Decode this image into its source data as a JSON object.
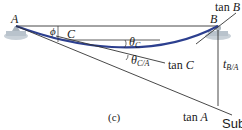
{
  "figure": {
    "caption": "(c)",
    "trailing_text": "Sub",
    "points": {
      "A": "A",
      "B": "B",
      "C": "C"
    },
    "labels": {
      "tan_B": {
        "word": "tan",
        "var": "B"
      },
      "tan_C": {
        "word": "tan",
        "var": "C"
      },
      "tan_A": {
        "word": "tan",
        "var": "A"
      },
      "theta_C": {
        "sym": "θ",
        "sub": "C"
      },
      "theta_CA": {
        "sym": "θ",
        "sub": "C/A"
      },
      "t_BA": {
        "sym": "t",
        "sub": "B/A"
      },
      "phi": "ϕ"
    },
    "colors": {
      "beam_curve": "#2c3f8f",
      "lines": "#333333",
      "support": "#b9c3cc"
    }
  }
}
